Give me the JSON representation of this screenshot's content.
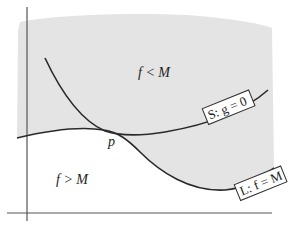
{
  "diagram": {
    "colors": {
      "region_shade": "#e4e4e4",
      "curve": "#2a2a2a",
      "axis": "#555555",
      "label_box_fill": "#ffffff",
      "label_box_stroke": "#333333"
    },
    "regions": {
      "upper_label": "f < M",
      "lower_label": "f > M"
    },
    "point": {
      "label": "p"
    },
    "curves": {
      "S": {
        "label": "S: g = 0"
      },
      "L": {
        "label": "L: f = M"
      }
    }
  }
}
